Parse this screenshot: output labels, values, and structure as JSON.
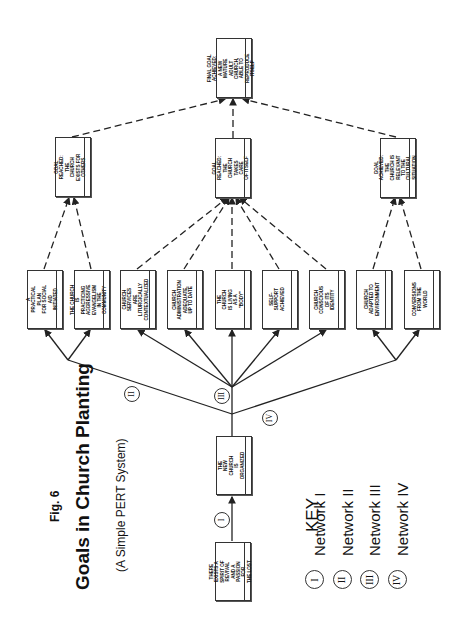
{
  "figure": {
    "label": "Fig. 6",
    "title": "Goals in Church Planting",
    "subtitle": "(A Simple PERT System)",
    "orientation": "rotated 90° counter-clockwise"
  },
  "nodes": {
    "start": {
      "text": "There exists a\nspirit of\nrevival and a\npassion for\nthe lost"
    },
    "organized": {
      "text": "The\nnew church\nis organized"
    },
    "social_aid": {
      "text": "A practical plan\nfor social aid\ninitiated"
    },
    "evangelism": {
      "text": "The church is\npracticing\naggressive\nevangelism\nin the community"
    },
    "services": {
      "text": "Church services\nare liturgically\ncontextualized"
    },
    "administration": {
      "text": "Church\nadministration\nadequate,\nup to date"
    },
    "body": {
      "text": "The church\nis living\nas a\n\"body\""
    },
    "self_support": {
      "text": "Self-support\nachieved"
    },
    "identity": {
      "text": "Church conscious\nof its\nidentity"
    },
    "adapted": {
      "text": "Church\nadapted to\nenvironment"
    },
    "conversions": {
      "text": "Conversions\nfrom the\nworld"
    },
    "goal_others": {
      "text": "Goal reached:\nthe church\nexists for others"
    },
    "goal_itself": {
      "text": "Goal reached:\nthe church\ntakes care\nof itself"
    },
    "goal_relevant": {
      "text": "Goal achieved:\nthe church is\nrelevant to the\ncultural situation"
    },
    "final": {
      "text": "Final goal\nachieved: a new\nmature adult\nchurch, able to\nreproduce itself"
    }
  },
  "network_labels": {
    "n1": "I",
    "n2": "II",
    "n3": "III",
    "n4": "IV"
  },
  "key": {
    "heading": "KEY",
    "items": [
      {
        "symbol": "I",
        "label": "Network I"
      },
      {
        "symbol": "II",
        "label": "Network II"
      },
      {
        "symbol": "III",
        "label": "Network III"
      },
      {
        "symbol": "IV",
        "label": "Network IV"
      }
    ]
  },
  "colors": {
    "line": "#222222",
    "box_border": "#333333",
    "background": "#ffffff"
  }
}
